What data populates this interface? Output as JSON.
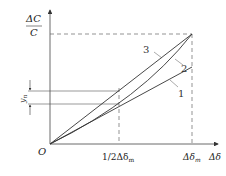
{
  "diagram": {
    "y_axis_label_numerator": "ΔC",
    "y_axis_label_denominator": "C",
    "x_axis_label": "Δδ",
    "origin_label": "O",
    "x_ticks": [
      {
        "label": "1/2Δδ",
        "sub": "m"
      },
      {
        "label": "Δδ",
        "sub": "m"
      }
    ],
    "yn_label": "y",
    "yn_sub": "n",
    "curves": [
      {
        "id": "1",
        "label": "1",
        "description": "straight line, lowest"
      },
      {
        "id": "2",
        "label": "2",
        "description": "curved (convex) line ending at max point"
      },
      {
        "id": "3",
        "label": "3",
        "description": "straight line ending at max point"
      }
    ],
    "colors": {
      "line": "#333333",
      "dashed": "#555555"
    }
  }
}
